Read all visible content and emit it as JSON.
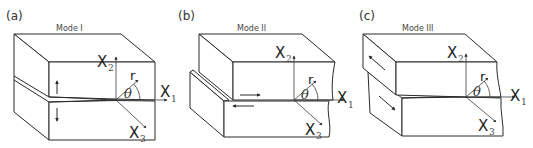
{
  "figure": {
    "panels": [
      {
        "id": "a",
        "label": "(a)",
        "title": "Mode I",
        "axes": {
          "x1": "X",
          "x1_sub": "1",
          "x2": "X",
          "x2_sub": "2",
          "x3": "X",
          "x3_sub": "3",
          "r": "r",
          "theta": "θ"
        },
        "loading": "opening (tensile, arrows up/down)"
      },
      {
        "id": "b",
        "label": "(b)",
        "title": "Mode II",
        "axes": {
          "x1": "X",
          "x1_sub": "1",
          "x2": "X",
          "x2_sub": "2",
          "x3": "X",
          "x3_sub": "3",
          "r": "r",
          "theta": "θ"
        },
        "loading": "in-plane shear (arrows left/right)"
      },
      {
        "id": "c",
        "label": "(c)",
        "title": "Mode III",
        "axes": {
          "x1": "X",
          "x1_sub": "1",
          "x2": "X",
          "x2_sub": "2",
          "x3": "X",
          "x3_sub": "3",
          "r": "r",
          "theta": "θ"
        },
        "loading": "out-of-plane shear (tearing, arrows diagonal)"
      }
    ],
    "colors": {
      "line": "#2a2a2a",
      "background": "#ffffff"
    }
  }
}
